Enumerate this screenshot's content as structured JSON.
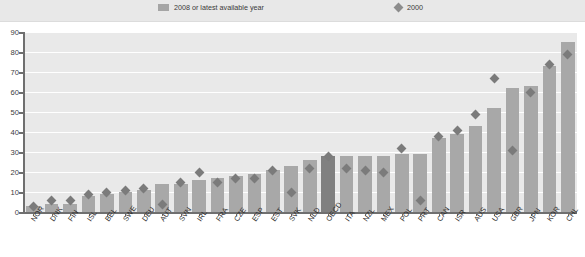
{
  "legend": {
    "entries": [
      {
        "label": "2008 or latest available year",
        "marker": "bar-swatch-icon",
        "color": "#a5a5a5"
      },
      {
        "label": "2000",
        "marker": "diamond-icon",
        "color": "#8c8c8c"
      }
    ]
  },
  "chart_data": {
    "type": "bar",
    "title": "",
    "subtitle": "",
    "xlabel": "",
    "ylabel": "",
    "ylim": [
      0,
      90
    ],
    "ytick_step": 10,
    "yticks": [
      0,
      10,
      20,
      30,
      40,
      50,
      60,
      70,
      80,
      90
    ],
    "grid": true,
    "legend_position": "top",
    "highlight_category": "OECD",
    "colors": {
      "bar": "#a8a8a8",
      "bar_highlight": "#808080",
      "point": "#7b7b7b",
      "plot_background": "#e9e9e9",
      "gridline": "#ffffff",
      "axis": "#6f6f6f"
    },
    "categories": [
      "NOR",
      "DNK",
      "FIN",
      "ISL",
      "BEL",
      "SWE",
      "DEU",
      "AUT",
      "SVN",
      "IRL",
      "FRA",
      "CZE",
      "ESP",
      "EST",
      "SVK",
      "NLD",
      "OECD",
      "ITA",
      "NZL",
      "MEX",
      "POL",
      "PRT",
      "CAN",
      "ISR",
      "AUS",
      "USA",
      "GBR",
      "JPN",
      "KOR",
      "CHL"
    ],
    "series": [
      {
        "name": "2008 or latest available year",
        "type": "bar",
        "values": [
          3,
          4,
          4,
          8,
          9,
          10,
          11,
          14,
          14,
          16,
          17,
          18,
          19,
          21,
          23,
          26,
          28,
          28,
          28,
          28,
          29,
          29,
          37,
          39,
          43,
          52,
          62,
          63,
          73,
          85
        ]
      },
      {
        "name": "2000",
        "type": "scatter",
        "marker": "diamond",
        "values": [
          3,
          6,
          6,
          9,
          10,
          11,
          12,
          4,
          15,
          20,
          15,
          17,
          17,
          21,
          10,
          22,
          28,
          22,
          21,
          20,
          32,
          6,
          38,
          41,
          49,
          67,
          31,
          60,
          74,
          79
        ]
      }
    ]
  }
}
